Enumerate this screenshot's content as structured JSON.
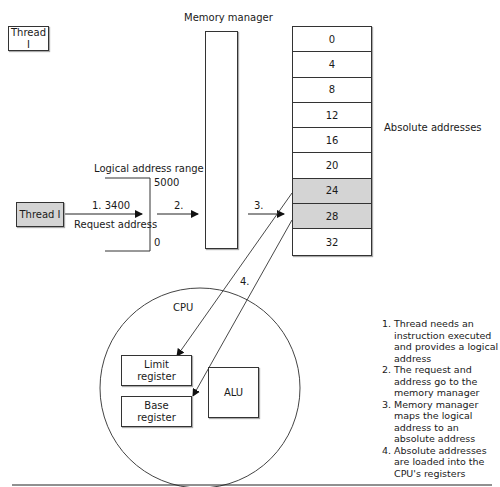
{
  "diagram": {
    "thread_top_label": "Thread I",
    "thread_request_label": "Thread I",
    "memory_manager_label": "Memory manager",
    "absolute_addresses_label": "Absolute addresses",
    "logical_range": {
      "label": "Logical address range",
      "max": "5000",
      "min": "0"
    },
    "request": {
      "step_label": "1.  3400",
      "caption": "Request address"
    },
    "arrow_labels": {
      "step2": "2.",
      "step3": "3.",
      "step4": "4."
    },
    "memory_table": {
      "rows": [
        {
          "value": "0",
          "highlighted": false
        },
        {
          "value": "4",
          "highlighted": false
        },
        {
          "value": "8",
          "highlighted": false
        },
        {
          "value": "12",
          "highlighted": false
        },
        {
          "value": "16",
          "highlighted": false
        },
        {
          "value": "20",
          "highlighted": false
        },
        {
          "value": "24",
          "highlighted": true
        },
        {
          "value": "28",
          "highlighted": true
        },
        {
          "value": "32",
          "highlighted": false
        }
      ]
    },
    "cpu": {
      "label": "CPU",
      "limit_register": "Limit register",
      "base_register": "Base register",
      "alu": "ALU"
    },
    "steps": [
      {
        "num": "1.",
        "text": "Thread needs an instruction executed and provides a logical address"
      },
      {
        "num": "2.",
        "text": "The request and address go to the memory manager"
      },
      {
        "num": "3.",
        "text": "Memory manager maps the logical address to an absolute address"
      },
      {
        "num": "4.",
        "text": "Absolute addresses are loaded into the CPU's registers"
      }
    ],
    "colors": {
      "highlight_fill": "#d4d4d4",
      "line": "#333333",
      "background": "#ffffff"
    }
  }
}
